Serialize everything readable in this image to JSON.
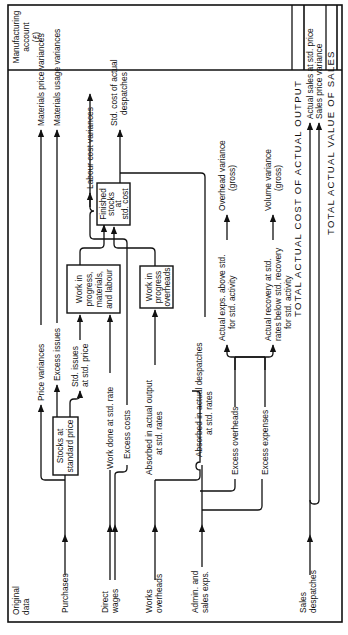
{
  "diagram": {
    "orientation": "rotated 90 degrees counter-clockwise",
    "header": {
      "left": [
        "Original",
        "data"
      ],
      "right": [
        "Manufacturing",
        "account",
        "(£)"
      ]
    },
    "inputs": {
      "purchases": "Purchases",
      "direct_wages": [
        "Direct",
        "wages"
      ],
      "works_overheads": [
        "Works",
        "overheads"
      ],
      "admin_sales": [
        "Admin. and",
        "sales exps."
      ],
      "sales_despatches": [
        "Sales",
        "despatches"
      ]
    },
    "boxes": {
      "stocks": [
        "Stocks at",
        "standard price"
      ],
      "wip_ml": [
        "Work in",
        "progress,",
        "materials,",
        "and labour"
      ],
      "wip_oh": [
        "Work in",
        "progress",
        "overheads"
      ],
      "finished": [
        "Finished",
        "stocks",
        "at",
        "std. cost"
      ]
    },
    "flows": {
      "price_variances": "Price variances",
      "excess_issues": "Excess issues",
      "std_issues": [
        "Std. issues",
        "at std. price"
      ],
      "work_done": "Work done at std. rate",
      "excess_costs": "Excess costs",
      "absorbed_output": [
        "Absorbed in actual output",
        "at std. rates"
      ],
      "absorbed_despatches": [
        "Absorbed in actual despatches",
        "at std. rates"
      ],
      "excess_overheads": "Excess overheads",
      "excess_expenses": "Excess expenses",
      "actual_exps_above": [
        "Actual exps. above std.",
        "for std. activity"
      ],
      "actual_recovery": [
        "Actual recovery at std.",
        "rates below std. recovery",
        "for std. activity"
      ]
    },
    "outputs": {
      "materials_price": "Materials price variances",
      "materials_usage": "Materials usage variances",
      "labour_cost": "Labour cost variances",
      "std_cost_despatches": [
        "Std. cost of actual",
        "despatches"
      ],
      "overhead_variance": [
        "Overhead variance",
        "(gross)"
      ],
      "volume_variance": [
        "Volume variance",
        "(gross)"
      ],
      "total_cost": "TOTAL  ACTUAL  COST  OF  ACTUAL  OUTPUT",
      "actual_sales": "Actual sales at std. price",
      "sales_price_variance": "Sales price variance",
      "total_sales": "TOTAL  ACTUAL  VALUE  OF  SALES"
    }
  }
}
